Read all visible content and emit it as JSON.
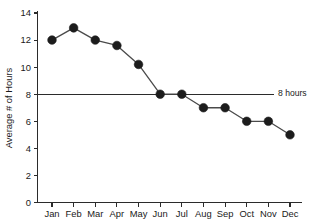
{
  "chart_data": {
    "type": "line",
    "title": "",
    "xlabel": "",
    "ylabel": "Average # of Hours",
    "categories": [
      "Jan",
      "Feb",
      "Mar",
      "Apr",
      "May",
      "Jun",
      "Jul",
      "Aug",
      "Sep",
      "Oct",
      "Nov",
      "Dec"
    ],
    "values": [
      12,
      12.9,
      12,
      11.6,
      10.2,
      8,
      8,
      7,
      7,
      6,
      6,
      5
    ],
    "series": [
      {
        "name": "Average # of Hours",
        "values": [
          12,
          12.9,
          12,
          11.6,
          10.2,
          8,
          8,
          7,
          7,
          6,
          6,
          5
        ]
      }
    ],
    "ylim": [
      0,
      14
    ],
    "yticks": [
      0,
      2,
      4,
      6,
      8,
      10,
      12,
      14
    ],
    "ytick_labels": [
      "0",
      "2",
      "4",
      "6",
      "8",
      "10",
      "12",
      "14"
    ],
    "grid": false,
    "legend": "none",
    "marker": "filled-circle",
    "annotations": [
      {
        "name": "reference-line-8-hours",
        "type": "horizontal-line",
        "y": 8,
        "label": "8 hours"
      }
    ],
    "colors": {
      "line": "#4a4a4a",
      "marker": "#1c1c1c",
      "axis": "#2b2b2b",
      "text": "#1a1a1a",
      "background": "#ffffff"
    }
  }
}
